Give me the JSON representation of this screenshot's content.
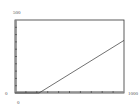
{
  "chart_data": {
    "type": "line",
    "title": "",
    "xlabel": "",
    "ylabel": "",
    "xlim": [
      0,
      1000
    ],
    "ylim": [
      0,
      500
    ],
    "x_tick_labels": [
      "0",
      "1000"
    ],
    "y_tick_labels": [
      "0",
      "500"
    ],
    "x_tick_count": 10,
    "y_tick_count": 10,
    "grid": false,
    "legend": null,
    "series": [
      {
        "name": "line",
        "x": [
          0,
          220,
          1000
        ],
        "y": [
          0,
          0,
          360
        ]
      }
    ]
  },
  "labels": {
    "y_max": "500",
    "y_min": "0",
    "x_min": "0",
    "x_max": "1000"
  },
  "colors": {
    "frame": "#333333",
    "line": "#333333",
    "axis_thick": "#888888"
  }
}
